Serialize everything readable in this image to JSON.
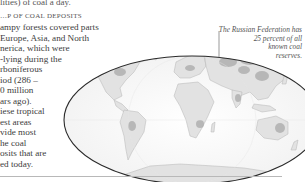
{
  "page": {
    "top_line": "lities) of coal a day.",
    "heading": "…P OF COAL DEPOSITS",
    "body_lines": [
      "ampy forests covered parts",
      "Europe, Asia, and North",
      "nerica, which were",
      "-lying during the",
      "rboniferous",
      "iod (286 –",
      "0 million",
      "ars ago).",
      "iese tropical",
      "est areas",
      "vide most",
      "he coal",
      "osits that are",
      "ed today."
    ]
  },
  "map": {
    "title": "World map of coal deposits",
    "projection": "elliptical",
    "land_color": "#e2e2e2",
    "deposit_color": "#a9a9a9",
    "outline_color": "#2a2a2a",
    "callout": {
      "lines": [
        "The Russian Federation has",
        "25 percent of all",
        "known coal",
        "reserves."
      ]
    }
  }
}
